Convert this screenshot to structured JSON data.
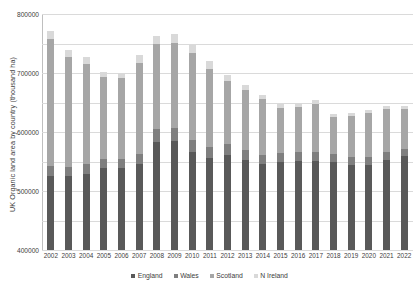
{
  "chart_data": {
    "type": "bar",
    "subtype": "stacked-column",
    "title": "",
    "xlabel": "",
    "ylabel": "UK Organic land area by country (thousand ha)",
    "ylim": [
      0,
      800000
    ],
    "yticks": [
      0,
      100000,
      200000,
      300000,
      400000,
      500000,
      600000,
      700000,
      800000
    ],
    "ytick_labels": [
      "0",
      "100000",
      "200000",
      "300000",
      "400000",
      "500000",
      "600000",
      "700000",
      "800000"
    ],
    "grid": true,
    "legend_position": "bottom",
    "categories": [
      "2002",
      "2003",
      "2004",
      "2005",
      "2006",
      "2007",
      "2008",
      "2009",
      "2010",
      "2011",
      "2012",
      "2013",
      "2014",
      "2015",
      "2016",
      "2017",
      "2018",
      "2019",
      "2020",
      "2021",
      "2022"
    ],
    "series": [
      {
        "name": "England",
        "color": "#595959",
        "values": [
          252000,
          250000,
          257000,
          277000,
          277000,
          290000,
          365000,
          370000,
          332000,
          312000,
          322000,
          305000,
          291000,
          299000,
          302000,
          303000,
          300000,
          289000,
          289000,
          306000,
          318000
        ]
      },
      {
        "name": "Wales",
        "color": "#7f7f7f",
        "values": [
          32000,
          33000,
          34000,
          33000,
          33000,
          37000,
          45000,
          44000,
          41000,
          38000,
          38000,
          34000,
          31000,
          30000,
          29000,
          28000,
          27000,
          26000,
          26000,
          26000,
          26000
        ]
      },
      {
        "name": "Scotland",
        "color": "#a6a6a6",
        "values": [
          430000,
          370000,
          340000,
          275000,
          272000,
          308000,
          287000,
          289000,
          296000,
          265000,
          212000,
          205000,
          190000,
          153000,
          155000,
          165000,
          125000,
          140000,
          148000,
          145000,
          133000
        ]
      },
      {
        "name": "N Ireland",
        "color": "#d9d9d9",
        "values": [
          28000,
          24000,
          22000,
          20000,
          18000,
          25000,
          30000,
          29000,
          27000,
          25000,
          22000,
          17000,
          13000,
          12000,
          12000,
          12000,
          10000,
          11000,
          11000,
          11000,
          10000
        ]
      }
    ]
  },
  "legend": {
    "items": [
      {
        "label": "England"
      },
      {
        "label": "Wales"
      },
      {
        "label": "Scotland"
      },
      {
        "label": "N Ireland"
      }
    ]
  }
}
